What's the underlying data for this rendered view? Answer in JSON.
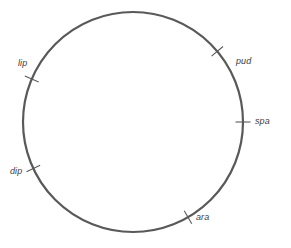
{
  "figure": {
    "type": "circle-landmark-diagram",
    "background_color": "#ffffff",
    "stroke_color": "#595959",
    "text_color": "#3c3c3c",
    "circle": {
      "cx": 133,
      "cy": 122,
      "r": 110,
      "stroke_width": 2.2
    },
    "tick": {
      "length": 15,
      "stroke_width": 1.1
    }
  },
  "labels": [
    {
      "id": "lip",
      "text": "lip",
      "angle_deg": 157,
      "x": 18,
      "y": 58,
      "tick_angle_deg": 157
    },
    {
      "id": "pud",
      "text": "pud",
      "angle_deg": 40,
      "x": 236,
      "y": 56,
      "tick_angle_deg": 40
    },
    {
      "id": "spa",
      "text": "spa",
      "angle_deg": 0,
      "x": 255,
      "y": 116,
      "tick_angle_deg": 0
    },
    {
      "id": "ara",
      "text": "ara",
      "angle_deg": 300,
      "x": 196,
      "y": 212,
      "tick_angle_deg": 300
    },
    {
      "id": "dip",
      "text": "dip",
      "angle_deg": 205,
      "x": 10,
      "y": 166,
      "tick_angle_deg": 205
    }
  ]
}
